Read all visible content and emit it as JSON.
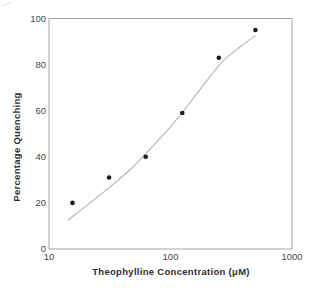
{
  "figure": {
    "background": "#ffffff"
  },
  "chart_data": {
    "type": "scatter",
    "title": "",
    "xlabel": "Theophylline Concentration (μM)",
    "ylabel": "Percentage Quenching",
    "x_scale": "log",
    "xlim": [
      10,
      1000
    ],
    "ylim": [
      0,
      100
    ],
    "xticks": [
      "10",
      "100",
      "1000"
    ],
    "xtick_values": [
      10,
      100,
      1000
    ],
    "yticks": [
      "0",
      "20",
      "40",
      "60",
      "80",
      "100"
    ],
    "ytick_values": [
      0,
      20,
      40,
      60,
      80,
      100
    ],
    "grid": false,
    "legend": "none",
    "series": [
      {
        "name": "calibration-points",
        "marker": "filled-circle",
        "x": [
          15.6,
          31.25,
          62.5,
          125,
          250,
          500
        ],
        "y": [
          20,
          31,
          40,
          59,
          83,
          95
        ]
      }
    ],
    "fit_curve": {
      "name": "sigmoid-fit",
      "points": [
        [
          14.3,
          12.5
        ],
        [
          20,
          18.5
        ],
        [
          30.7,
          26.3
        ],
        [
          46.7,
          34.5
        ],
        [
          63,
          41.5
        ],
        [
          100,
          53
        ],
        [
          133,
          61
        ],
        [
          180,
          70
        ],
        [
          264,
          81
        ],
        [
          380,
          88
        ],
        [
          500,
          92.5
        ]
      ]
    },
    "colors": {
      "point": "#1c1c1c",
      "curve": "#b3b3b3",
      "frame": "#a5a5a5",
      "tick_label": "#474747",
      "axis_title": "#303030",
      "artifact": "#d9d9d9",
      "background": "#ffffff"
    }
  }
}
